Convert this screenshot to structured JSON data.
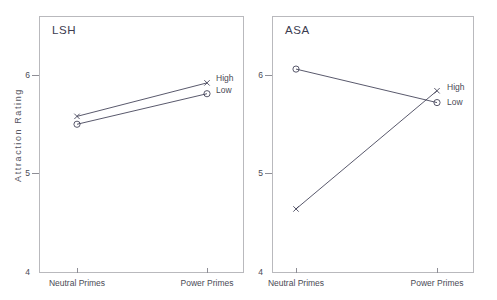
{
  "figure": {
    "ylabel": "Attraction Rating",
    "panels": [
      {
        "title": "LSH",
        "xticklabels": [
          "Neutral Primes",
          "Power Primes"
        ],
        "yticklabels": [
          "4",
          "5",
          "6"
        ],
        "series_labels": [
          "High",
          "Low"
        ]
      },
      {
        "title": "ASA",
        "xticklabels": [
          "Neutral Primes",
          "Power Primes"
        ],
        "yticklabels": [
          "4",
          "5",
          "6"
        ],
        "series_labels": [
          "High",
          "Low"
        ]
      }
    ]
  },
  "chart_data": [
    {
      "type": "line",
      "title": "LSH",
      "xlabel": "",
      "ylabel": "Attraction Rating",
      "categories": [
        "Neutral Primes",
        "Power Primes"
      ],
      "yticks": [
        4,
        5,
        6
      ],
      "ylim": [
        4,
        6.3
      ],
      "grid": false,
      "legend_position": "right-inline",
      "series": [
        {
          "name": "High",
          "marker": "x",
          "values": [
            5.58,
            5.92
          ]
        },
        {
          "name": "Low",
          "marker": "circle",
          "values": [
            5.5,
            5.81
          ]
        }
      ]
    },
    {
      "type": "line",
      "title": "ASA",
      "xlabel": "",
      "ylabel": "Attraction Rating",
      "categories": [
        "Neutral Primes",
        "Power Primes"
      ],
      "yticks": [
        4,
        5,
        6
      ],
      "ylim": [
        4,
        6.3
      ],
      "grid": false,
      "legend_position": "right-inline",
      "series": [
        {
          "name": "High",
          "marker": "x",
          "values": [
            4.64,
            5.84
          ]
        },
        {
          "name": "Low",
          "marker": "circle",
          "values": [
            6.06,
            5.72
          ]
        }
      ]
    }
  ],
  "colors": {
    "line": "#3b3b52",
    "frame": "#b9b9bd",
    "text": "#4a4a55",
    "background": "#ffffff"
  }
}
